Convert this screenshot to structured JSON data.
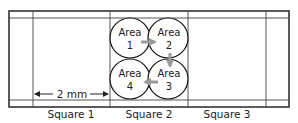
{
  "diagram": {
    "title": "",
    "scale_label": "2 mm",
    "squares": [
      {
        "label": "Square 1"
      },
      {
        "label": "Square 2"
      },
      {
        "label": "Square 3"
      }
    ],
    "areas": [
      {
        "line1": "Area",
        "line2": "1"
      },
      {
        "line1": "Area",
        "line2": "2"
      },
      {
        "line1": "Area",
        "line2": "3"
      },
      {
        "line1": "Area",
        "line2": "4"
      }
    ],
    "arrow_sequence": [
      "Area 1 → Area 2",
      "Area 2 → Area 3",
      "Area 3 → Area 4"
    ],
    "colors": {
      "lines": "#333333",
      "arrows": "#9a9a9a",
      "text": "#222222"
    }
  }
}
